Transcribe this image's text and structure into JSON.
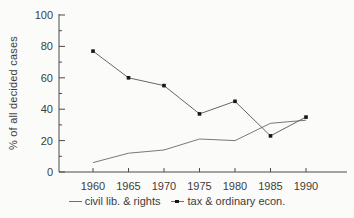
{
  "figure": {
    "background": "#fbfbf9",
    "axis_color": "#4a4a4a",
    "text_color": "#3d3d3d"
  },
  "chart_data": {
    "type": "line",
    "x": [
      "1960",
      "1965",
      "1970",
      "1975",
      "1980",
      "1985",
      "1990"
    ],
    "series": [
      {
        "name": "civil lib. & rights",
        "values": [
          6,
          12,
          14,
          21,
          20,
          31,
          33
        ],
        "marker": "none",
        "color": "#787878"
      },
      {
        "name": "tax & ordinary econ.",
        "values": [
          77,
          60,
          55,
          37,
          45,
          23,
          35
        ],
        "marker": "square",
        "color": "#666666",
        "marker_color": "#161616"
      }
    ],
    "ylabel": "% of all decided cases",
    "ylim": [
      0,
      100
    ],
    "yticks": [
      0,
      20,
      40,
      60,
      80,
      100
    ],
    "yticks_minor": [
      10,
      30,
      50,
      70,
      90
    ],
    "grid": false,
    "legend_position": "bottom"
  }
}
